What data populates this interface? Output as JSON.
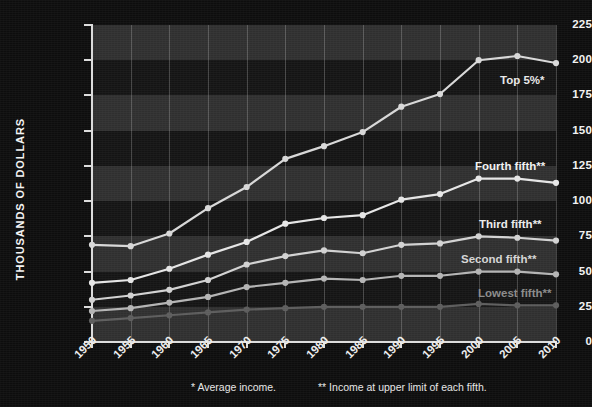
{
  "chart_data": {
    "type": "line",
    "title": "",
    "xlabel": "",
    "ylabel": "THOUSANDS OF DOLLARS",
    "x": [
      1950,
      1955,
      1960,
      1965,
      1970,
      1975,
      1980,
      1985,
      1990,
      1995,
      2000,
      2005,
      2010
    ],
    "xtick_labels": [
      "1950",
      "1955",
      "1960",
      "1965",
      "1970",
      "1975",
      "1980",
      "1985",
      "1990",
      "1995",
      "2000",
      "2005",
      "2010"
    ],
    "ytick_labels": [
      "0",
      "25",
      "50",
      "75",
      "100",
      "125",
      "150",
      "175",
      "200",
      "225"
    ],
    "yticks": [
      0,
      25,
      50,
      75,
      100,
      125,
      150,
      175,
      200,
      225
    ],
    "ylim": [
      0,
      225
    ],
    "xlim": [
      1950,
      2010
    ],
    "grid": "horizontal-bands-and-vertical-lines",
    "legend": "inline-right-labels",
    "series": [
      {
        "name": "Top 5%*",
        "color": "#d8d8d8",
        "label_color": "#e9e9e9",
        "label_x": 500,
        "label_y": 74,
        "values": [
          69,
          68,
          77,
          95,
          110,
          130,
          139,
          149,
          167,
          176,
          200,
          203,
          198
        ]
      },
      {
        "name": "Fourth fifth**",
        "color": "#e6e6e6",
        "label_color": "#f2f2f2",
        "label_x": 475,
        "label_y": 160,
        "values": [
          42,
          44,
          52,
          62,
          71,
          84,
          88,
          90,
          101,
          105,
          116,
          116,
          113
        ]
      },
      {
        "name": "Third fifth**",
        "color": "#d2d2d2",
        "label_color": "#ececec",
        "label_x": 479,
        "label_y": 218,
        "values": [
          30,
          33,
          37,
          44,
          55,
          61,
          65,
          63,
          69,
          70,
          75,
          74,
          72
        ]
      },
      {
        "name": "Second fifth**",
        "color": "#b4b4b4",
        "label_color": "#d5d5d5",
        "label_x": 461,
        "label_y": 253,
        "values": [
          22,
          24,
          28,
          32,
          39,
          42,
          45,
          44,
          47,
          47,
          50,
          50,
          48
        ]
      },
      {
        "name": "Lowest fifth**",
        "color": "#5c5c5c",
        "label_color": "#8b8b8b",
        "label_x": 478,
        "label_y": 287,
        "values": [
          15,
          17,
          19,
          21,
          23,
          24,
          25,
          25,
          25,
          25,
          27,
          26,
          26
        ]
      }
    ],
    "footnotes": {
      "first": "* Average income.",
      "second": "** Income at upper limit of each fifth."
    }
  },
  "colors": {
    "background": "#0d0d0d",
    "plot_background": "#2f2f2f",
    "band_dark": "#141414",
    "axis": "#dcdcdc",
    "text": "#f0f0f0"
  }
}
